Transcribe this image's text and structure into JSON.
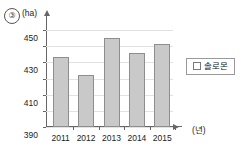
{
  "item_number": "③",
  "legend": {
    "position": "right",
    "swatch_icon": "square-swatch-icon",
    "entries": [
      "솔로몬"
    ]
  },
  "axes": {
    "y_unit": "(ha)",
    "x_unit": "(년)"
  },
  "chart_data": {
    "type": "bar",
    "title": "",
    "xlabel": "년",
    "ylabel": "ha",
    "categories": [
      "2011",
      "2012",
      "2013",
      "2014",
      "2015"
    ],
    "values": [
      417,
      395,
      440,
      422,
      433
    ],
    "series": [
      {
        "name": "솔로몬",
        "values": [
          417,
          395,
          440,
          422,
          433
        ]
      }
    ],
    "ylim": [
      330,
      460
    ],
    "yticks": [
      330,
      350,
      370,
      390,
      410,
      430,
      450
    ],
    "ytick_labels": [
      "330",
      "350",
      "370",
      "390",
      "410",
      "430",
      "450"
    ],
    "grid": true,
    "bar_color": "#c9c9c9",
    "bar_border_color": "#8e8e8e",
    "axis_color": "#666666",
    "grid_color": "#e2e2e2"
  }
}
